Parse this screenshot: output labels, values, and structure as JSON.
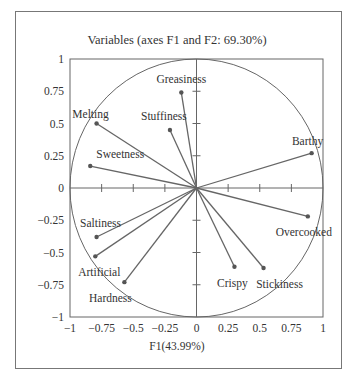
{
  "chart_data": {
    "type": "scatter",
    "subtype": "correlation-circle-biplot",
    "title": "Variables (axes F1 and F2: 69.30%)",
    "xlabel": "F1(43.99%)",
    "ylabel": "",
    "xlim": [
      -1,
      1
    ],
    "ylim": [
      -1,
      1
    ],
    "xticks": [
      "-1",
      "-0.75",
      "-0.5",
      "-0.25",
      "0",
      "0.25",
      "0.5",
      "0.75",
      "1"
    ],
    "yticks": [
      "1",
      "0.75",
      "0.5",
      "0.25",
      "0",
      "-0.25",
      "-0.5",
      "-0.75",
      "-1"
    ],
    "grid": false,
    "unit_circle": true,
    "points": [
      {
        "label": "Greasiness",
        "x": -0.12,
        "y": 0.74
      },
      {
        "label": "Stuffiness",
        "x": -0.21,
        "y": 0.45
      },
      {
        "label": "Melting",
        "x": -0.79,
        "y": 0.5
      },
      {
        "label": "Sweetness",
        "x": -0.84,
        "y": 0.17
      },
      {
        "label": "Barthy",
        "x": 0.91,
        "y": 0.27
      },
      {
        "label": "Overcooked",
        "x": 0.88,
        "y": -0.22
      },
      {
        "label": "Stickiness",
        "x": 0.53,
        "y": -0.62
      },
      {
        "label": "Crispy",
        "x": 0.3,
        "y": -0.61
      },
      {
        "label": "Saltiness",
        "x": -0.79,
        "y": -0.38
      },
      {
        "label": "Artificial",
        "x": -0.8,
        "y": -0.53
      },
      {
        "label": "Hardness",
        "x": -0.57,
        "y": -0.73
      }
    ]
  }
}
